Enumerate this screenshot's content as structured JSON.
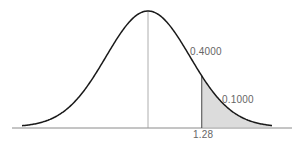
{
  "chart_data": {
    "type": "area",
    "title": "",
    "xlabel": "",
    "ylabel": "",
    "distribution": {
      "mean": 0,
      "std": 1
    },
    "annotations": [
      {
        "text": "0.4000",
        "meaning": "area between mean and z=1.28"
      },
      {
        "text": "0.1000",
        "meaning": "shaded right-tail area beyond z=1.28"
      }
    ],
    "x_tick_labels": [
      "1.28"
    ],
    "cutoff_z": 1.28,
    "areas": {
      "mean_to_cutoff": 0.4,
      "right_tail": 0.1
    },
    "colors": {
      "curve": "#222222",
      "shade": "#d9d9d9",
      "axis": "#888888"
    }
  },
  "labels": {
    "area_center": "0.4000",
    "area_tail": "0.1000",
    "cutoff_tick": "1.28"
  }
}
